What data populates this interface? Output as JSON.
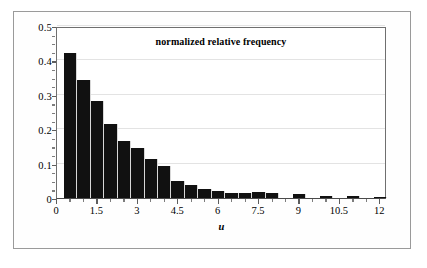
{
  "chart_data": {
    "type": "bar",
    "title": "normalized relative frequency",
    "xlabel": "u",
    "ylabel": "",
    "xlim": [
      0,
      12.25
    ],
    "ylim": [
      0,
      0.5
    ],
    "grid": true,
    "legend": null,
    "bin_width": 0.5,
    "x_ticks": [
      0,
      1.5,
      3,
      4.5,
      6,
      7.5,
      9,
      10.5,
      12
    ],
    "x_tick_labels": [
      "0",
      "1.5",
      "3",
      "4.5",
      "6",
      "7.5",
      "9",
      "10.5",
      "12"
    ],
    "x_minor_step": 0.5,
    "y_ticks": [
      0,
      0.1,
      0.2,
      0.3,
      0.4,
      0.5
    ],
    "y_tick_labels": [
      "0",
      "0.1",
      "0.2",
      "0.3",
      "0.4",
      "0.5"
    ],
    "y_minor_step": 0.025,
    "bar_color": "#111111",
    "bin_left_edges": [
      0.25,
      0.75,
      1.25,
      1.75,
      2.25,
      2.75,
      3.25,
      3.75,
      4.25,
      4.75,
      5.25,
      5.75,
      6.25,
      6.75,
      7.25,
      7.75,
      8.75,
      9.75,
      10.75,
      11.75
    ],
    "categories": [
      "0.25",
      "0.75",
      "1.25",
      "1.75",
      "2.25",
      "2.75",
      "3.25",
      "3.75",
      "4.25",
      "4.75",
      "5.25",
      "5.75",
      "6.25",
      "6.75",
      "7.25",
      "7.75",
      "8.75",
      "9.75",
      "10.75",
      "11.75"
    ],
    "values": [
      0.422,
      0.344,
      0.281,
      0.215,
      0.166,
      0.144,
      0.112,
      0.094,
      0.049,
      0.038,
      0.026,
      0.021,
      0.014,
      0.014,
      0.017,
      0.014,
      0.013,
      0.005,
      0.005,
      0.003
    ]
  }
}
